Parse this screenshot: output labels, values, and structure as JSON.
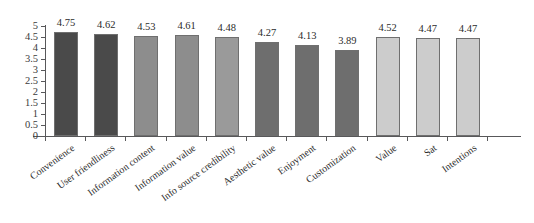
{
  "chart_data": {
    "type": "bar",
    "title": "",
    "subtitle": "",
    "xlabel": "",
    "ylabel": "",
    "ylim": [
      0,
      5
    ],
    "grid": false,
    "legend": "none",
    "categories": [
      "Convenience",
      "User friendliness",
      "Information content",
      "Information value",
      "Info source credibility",
      "Aesthetic value",
      "Enjoyment",
      "Customization",
      "Value",
      "Sat",
      "Intentions"
    ],
    "values": [
      4.75,
      4.62,
      4.53,
      4.61,
      4.48,
      4.27,
      4.13,
      3.89,
      4.52,
      4.47,
      4.47
    ],
    "value_labels": [
      "4.75",
      "4.62",
      "4.53",
      "4.61",
      "4.48",
      "4.27",
      "4.13",
      "3.89",
      "4.52",
      "4.47",
      "4.47"
    ],
    "bar_colors": [
      "#4a4a4a",
      "#4a4a4a",
      "#8d8d8d",
      "#8d8d8d",
      "#9a9a9a",
      "#6e6e6e",
      "#6e6e6e",
      "#6e6e6e",
      "#cccccc",
      "#cccccc",
      "#cccccc"
    ],
    "bar_border_color": "#6f6f6f",
    "axis_color": "#58585a",
    "yticks": [
      "0",
      "0.5",
      "1",
      "1.5",
      "2",
      "2.5",
      "3",
      "3.5",
      "4",
      "4.5",
      "5"
    ],
    "ytick_values": [
      0,
      0.5,
      1,
      1.5,
      2,
      2.5,
      3,
      3.5,
      4,
      4.5,
      5
    ],
    "background": "#ffffff",
    "text_color": "#2c2c2c"
  }
}
